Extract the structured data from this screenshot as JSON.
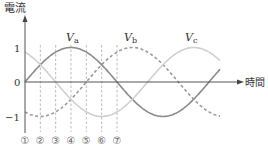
{
  "chart_data": {
    "type": "line",
    "title": "",
    "ylabel": "電流",
    "xlabel": "時間",
    "yticks": [
      "1",
      "0",
      "−1"
    ],
    "ylim": [
      -1,
      1
    ],
    "series": [
      {
        "name": "Va",
        "label": "V",
        "sub": "a",
        "style": "solid",
        "color": "#8a8a8a",
        "phase_deg": 0
      },
      {
        "name": "Vb",
        "label": "V",
        "sub": "b",
        "style": "dashed",
        "color": "#9a9a9a",
        "phase_deg": -120
      },
      {
        "name": "Vc",
        "label": "V",
        "sub": "c",
        "style": "solid",
        "color": "#d0d0d0",
        "phase_deg": -240
      }
    ],
    "markers": [
      "①",
      "②",
      "③",
      "④",
      "⑤",
      "⑥",
      "⑦"
    ],
    "marker_phase_deg": [
      0,
      30,
      60,
      90,
      120,
      150,
      180
    ]
  },
  "colors": {
    "axis": "#555555",
    "guide": "#aaaaaa"
  }
}
